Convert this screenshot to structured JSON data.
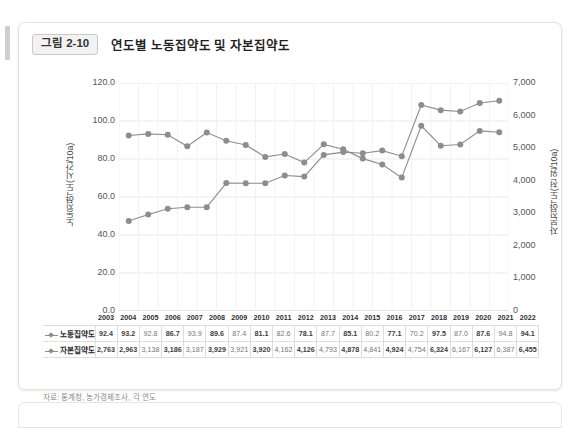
{
  "figure": {
    "badge": "그림 2-10",
    "title": "연도별 노동집약도 및 자본집약도",
    "source_note": "자료: 통계청, 농가경제조사, 각 연도"
  },
  "chart_data": {
    "type": "line",
    "title": "연도별 노동집약도 및 자본집약도",
    "xlabel": "",
    "ylabel": "노동집약도(시간/10a)",
    "y2label": "자본집약도(천 원/10a)",
    "ylim": [
      0,
      120
    ],
    "y2lim": [
      0,
      7000
    ],
    "yticks": [
      "0.0",
      "20.0",
      "40.0",
      "60.0",
      "80.0",
      "100.0",
      "120.0"
    ],
    "y2ticks": [
      "0",
      "1,000",
      "2,000",
      "3,000",
      "4,000",
      "5,000",
      "6,000",
      "7,000"
    ],
    "grid": true,
    "legend_position": "table-left",
    "categories": [
      "2003",
      "2004",
      "2005",
      "2006",
      "2007",
      "2008",
      "2009",
      "2010",
      "2011",
      "2012",
      "2013",
      "2014",
      "2015",
      "2016",
      "2017",
      "2018",
      "2019",
      "2020",
      "2021",
      "2022"
    ],
    "series": [
      {
        "name": "노동집약도",
        "axis": "left",
        "color": "#8d8d8d",
        "values": [
          92.4,
          93.2,
          92.8,
          86.7,
          93.9,
          89.6,
          87.4,
          81.1,
          82.6,
          78.1,
          87.7,
          85.1,
          80.2,
          77.1,
          70.2,
          97.5,
          87.0,
          87.6,
          94.8,
          94.1
        ],
        "display": [
          "92.4",
          "93.2",
          "92.8",
          "86.7",
          "93.9",
          "89.6",
          "87.4",
          "81.1",
          "82.6",
          "78.1",
          "87.7",
          "85.1",
          "80.2",
          "77.1",
          "70.2",
          "97.5",
          "87.0",
          "87.6",
          "94.8",
          "94.1"
        ]
      },
      {
        "name": "자본집약도",
        "axis": "right",
        "color": "#8d8d8d",
        "values": [
          2763,
          2963,
          3138,
          3186,
          3187,
          3929,
          3921,
          3920,
          4162,
          4126,
          4793,
          4878,
          4841,
          4924,
          4754,
          6324,
          6167,
          6127,
          6387,
          6455
        ],
        "display": [
          "2,763",
          "2,963",
          "3,138",
          "3,186",
          "3,187",
          "3,929",
          "3,921",
          "3,920",
          "4,162",
          "4,126",
          "4,793",
          "4,878",
          "4,841",
          "4,924",
          "4,754",
          "6,324",
          "6,167",
          "6,127",
          "6,387",
          "6,455"
        ]
      }
    ]
  }
}
